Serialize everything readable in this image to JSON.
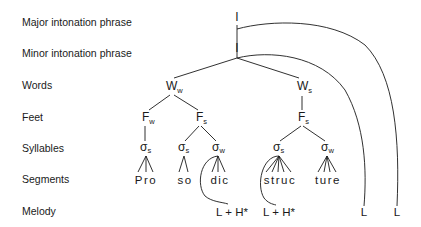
{
  "levels": {
    "major": "Major intonation phrase",
    "minor": "Minor intonation phrase",
    "words": "Words",
    "feet": "Feet",
    "syllables": "Syllables",
    "segments": "Segments",
    "melody": "Melody"
  },
  "tree": {
    "major_node": "I",
    "minor_node": "I",
    "words": [
      {
        "base": "W",
        "sub": "w"
      },
      {
        "base": "W",
        "sub": "s"
      }
    ],
    "feet": [
      {
        "base": "F",
        "sub": "w"
      },
      {
        "base": "F",
        "sub": "s"
      },
      {
        "base": "F",
        "sub": "s"
      }
    ],
    "syllables": [
      {
        "base": "σ",
        "sub": "s"
      },
      {
        "base": "σ",
        "sub": "s"
      },
      {
        "base": "σ",
        "sub": "w"
      },
      {
        "base": "σ",
        "sub": "s"
      },
      {
        "base": "σ",
        "sub": "w"
      }
    ],
    "segments": [
      "Pro",
      "so",
      "dic",
      "struc",
      "ture"
    ],
    "melody": [
      "L + H*",
      "L + H*",
      "L",
      "L"
    ]
  }
}
